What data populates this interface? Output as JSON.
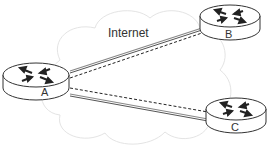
{
  "diagram": {
    "cloud_label": "Internet",
    "routers": [
      {
        "id": "A",
        "label": "A"
      },
      {
        "id": "B",
        "label": "B"
      },
      {
        "id": "C",
        "label": "C"
      }
    ],
    "links": [
      {
        "from": "A",
        "to": "B",
        "style": "solid-double"
      },
      {
        "from": "A",
        "to": "B",
        "style": "dashed"
      },
      {
        "from": "A",
        "to": "C",
        "style": "dashed"
      },
      {
        "from": "A",
        "to": "C",
        "style": "solid-double"
      }
    ]
  }
}
